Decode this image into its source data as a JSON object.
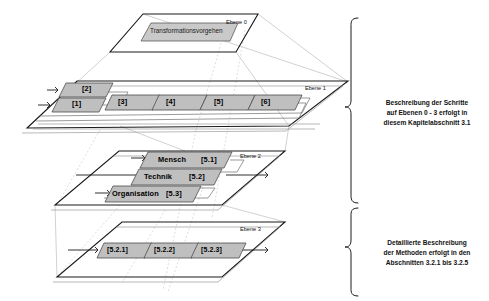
{
  "diagram": {
    "colors": {
      "node_fill": "#bfbfbf",
      "plane_stroke": "#1a1a1a",
      "connector": "#c4c4c4",
      "text": "#000000"
    },
    "planes": [
      {
        "id": "ebene0",
        "tag": "Ebene 0"
      },
      {
        "id": "ebene1",
        "tag": "Ebene 1"
      },
      {
        "id": "ebene2",
        "tag": "Ebene 2"
      },
      {
        "id": "ebene3",
        "tag": "Ebene 3"
      }
    ],
    "level0": {
      "tag": "Ebene 0",
      "nodes": [
        {
          "label": "Transformationsvorgehen"
        }
      ]
    },
    "level1": {
      "tag": "Ebene 1",
      "nodes": [
        {
          "label": "[2]"
        },
        {
          "label": "[1]"
        },
        {
          "label": "[3]"
        },
        {
          "label": "[4]"
        },
        {
          "label": "[5]"
        },
        {
          "label": "[6]"
        }
      ]
    },
    "level2": {
      "tag": "Ebene 2",
      "nodes": [
        {
          "label": "Mensch",
          "code": "[5.1]"
        },
        {
          "label": "Technik",
          "code": "[5.2]"
        },
        {
          "label": "Organisation",
          "code": "[5.3]"
        }
      ]
    },
    "level3": {
      "tag": "Ebene 3",
      "nodes": [
        {
          "label": "[5.2.1]"
        },
        {
          "label": "[5.2.2]"
        },
        {
          "label": "[5.2.3]"
        }
      ]
    },
    "annotations": [
      {
        "id": "upper",
        "line1": "Beschreibung der Schritte",
        "line2": "auf Ebenen 0 - 3 erfolgt in",
        "line3": "diesem Kapitelabschnitt 3.1"
      },
      {
        "id": "lower",
        "line1": "Detaillierte Beschreibung",
        "line2": "der Methoden erfolgt in den",
        "line3": "Abschnitten 3.2.1 bis 3.2.5"
      }
    ]
  }
}
